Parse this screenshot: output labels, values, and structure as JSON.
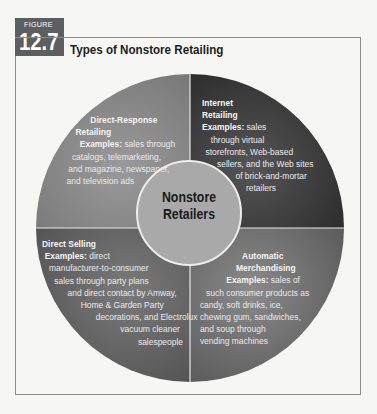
{
  "figure": {
    "label_word": "FIGURE",
    "number": "12.7",
    "title": "Types of Nonstore Retailing"
  },
  "center": {
    "line1": "Nonstore",
    "line2": "Retailers"
  },
  "quadrants": {
    "top_left": {
      "heading_lines": [
        "Direct-Response",
        "Retailing"
      ],
      "examples_label": "Examples:",
      "lines": [
        "sales through",
        "catalogs, telemarketing,",
        "and magazine, newspaper,",
        "and television ads"
      ]
    },
    "top_right": {
      "heading_lines": [
        "Internet",
        "Retailing"
      ],
      "examples_label": "Examples:",
      "lines": [
        "sales",
        "through virtual",
        "storefronts, Web-based",
        "sellers, and the Web sites",
        "of brick-and-mortar",
        "retailers"
      ]
    },
    "bottom_left": {
      "heading_lines": [
        "Direct Selling"
      ],
      "examples_label": "Examples:",
      "lines": [
        "direct",
        "manufacturer-to-consumer",
        "sales through party plans",
        "and direct contact by Amway,",
        "Home & Garden Party",
        "decorations, and Electrolux",
        "vacuum cleaner",
        "salespeople"
      ]
    },
    "bottom_right": {
      "heading_lines": [
        "Automatic",
        "Merchandising"
      ],
      "examples_label": "Examples:",
      "lines": [
        "sales of",
        "such consumer products as",
        "candy, soft drinks, ice,",
        "chewing gum, sandwiches,",
        "and soup through",
        "vending machines"
      ]
    }
  },
  "colors": {
    "figure_label_bg": "#5d5e60",
    "top_left": "#8c8c8c",
    "top_right": "#3f3f40",
    "bottom_left": "#6a6a6b",
    "bottom_right": "#7b7b7c",
    "center": "#a9a9a9",
    "background": "#f6f6f4"
  }
}
